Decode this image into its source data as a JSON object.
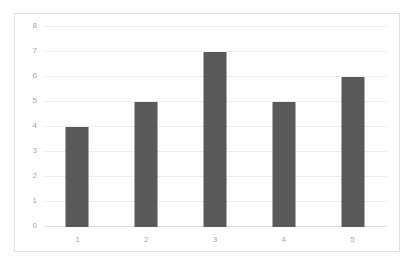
{
  "chart_data": {
    "type": "bar",
    "title": "",
    "subtitle": "",
    "xlabel": "",
    "ylabel": "",
    "categories": [
      "1",
      "2",
      "3",
      "4",
      "5"
    ],
    "values": [
      4,
      5,
      7,
      5,
      6
    ],
    "series": [
      {
        "name": "",
        "values": [
          4,
          5,
          7,
          5,
          6
        ]
      }
    ],
    "ylim": [
      0,
      8
    ],
    "yticks": [
      0,
      1,
      2,
      3,
      4,
      5,
      6,
      7,
      8
    ],
    "ytick_labels": [
      "0",
      "1",
      "2",
      "3",
      "4",
      "5",
      "6",
      "7",
      "8"
    ],
    "xtick_labels": [
      "1",
      "2",
      "3",
      "4",
      "5"
    ],
    "grid": true,
    "grid_axis": "y",
    "legend": false,
    "legend_position": "none",
    "colors": {
      "bar": "#595959",
      "gridline": "#ededed",
      "axis": "#e0e0e0",
      "tick_text": "#a6a6a6",
      "frame_border": "#e3e3e3",
      "background": "#ffffff"
    }
  }
}
